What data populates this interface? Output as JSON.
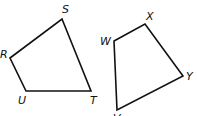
{
  "figures": [
    {
      "name": "RSTU",
      "vertices": [
        {
          "label": "R",
          "x": 10,
          "y": 58,
          "lx": 0,
          "ly": 58
        },
        {
          "label": "S",
          "x": 62,
          "y": 19,
          "lx": 62,
          "ly": 13
        },
        {
          "label": "T",
          "x": 91,
          "y": 91,
          "lx": 90,
          "ly": 104
        },
        {
          "label": "U",
          "x": 26,
          "y": 91,
          "lx": 18,
          "ly": 104
        }
      ]
    },
    {
      "name": "WXYV",
      "vertices": [
        {
          "label": "W",
          "x": 114,
          "y": 41,
          "lx": 100,
          "ly": 45
        },
        {
          "label": "X",
          "x": 145,
          "y": 24,
          "lx": 146,
          "ly": 20
        },
        {
          "label": "Y",
          "x": 183,
          "y": 76,
          "lx": 186,
          "ly": 80
        },
        {
          "label": "V",
          "x": 117,
          "y": 110,
          "lx": 113,
          "ly": 122
        }
      ]
    }
  ],
  "colors": {
    "stroke": "#111111",
    "background": "#ffffff"
  }
}
